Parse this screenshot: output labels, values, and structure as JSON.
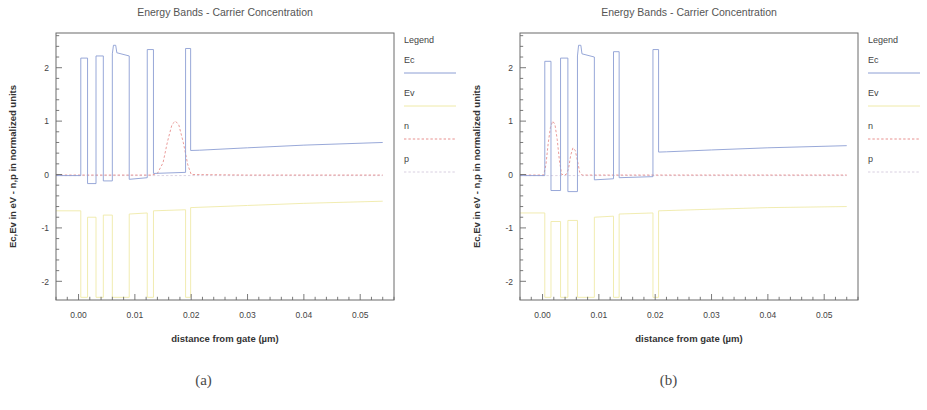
{
  "figure": {
    "captions": [
      {
        "id": "a",
        "label": "(a)"
      },
      {
        "id": "b",
        "label": "(b)"
      }
    ]
  },
  "chart_data": [
    {
      "panel": "a",
      "type": "line",
      "title": "Energy Bands - Carrier Concentration",
      "xlabel": "distance from gate (µm)",
      "ylabel": "Ec,Ev in eV - n,p in normalized units",
      "xlim": [
        -0.004,
        0.056
      ],
      "ylim": [
        -2.35,
        2.65
      ],
      "xticks": [
        0.0,
        0.01,
        0.02,
        0.03,
        0.04,
        0.05
      ],
      "xticklabels": [
        "0.00",
        "0.01",
        "0.02",
        "0.03",
        "0.04",
        "0.05"
      ],
      "yticks": [
        -2,
        -1,
        0,
        1,
        2
      ],
      "yticklabels": [
        "-2",
        "-1",
        "0",
        "1",
        "2"
      ],
      "xminor_count": 5,
      "yminor_count": 5,
      "grid": false,
      "legend": {
        "title": "Legend",
        "position": "right-outside",
        "entries": [
          {
            "name": "Ec",
            "color": "#8c9ed4",
            "style": "solid"
          },
          {
            "name": "Ev",
            "color": "#efeaa8",
            "style": "solid"
          },
          {
            "name": "n",
            "color": "#e8918f",
            "style": "dashed"
          },
          {
            "name": "p",
            "color": "#d8cfe0",
            "style": "dashed"
          }
        ]
      },
      "series": [
        {
          "name": "Ec",
          "color": "#8c9ed4",
          "style": "solid",
          "points": [
            [
              -0.004,
              -0.02
            ],
            [
              0.0004,
              -0.02
            ],
            [
              0.0004,
              2.18
            ],
            [
              0.0016,
              2.18
            ],
            [
              0.0016,
              -0.17
            ],
            [
              0.0031,
              -0.17
            ],
            [
              0.0031,
              2.22
            ],
            [
              0.0044,
              2.22
            ],
            [
              0.0044,
              -0.12
            ],
            [
              0.006,
              -0.12
            ],
            [
              0.006,
              2.26
            ],
            [
              0.0062,
              2.42
            ],
            [
              0.0066,
              2.42
            ],
            [
              0.0068,
              2.28
            ],
            [
              0.009,
              2.22
            ],
            [
              0.009,
              -0.09
            ],
            [
              0.0122,
              -0.06
            ],
            [
              0.0122,
              2.34
            ],
            [
              0.0133,
              2.34
            ],
            [
              0.0133,
              0.02
            ],
            [
              0.019,
              0.04
            ],
            [
              0.019,
              2.36
            ],
            [
              0.0199,
              2.36
            ],
            [
              0.0199,
              0.45
            ],
            [
              0.0215,
              0.455
            ],
            [
              0.03,
              0.5
            ],
            [
              0.04,
              0.55
            ],
            [
              0.054,
              0.6
            ]
          ]
        },
        {
          "name": "Ev",
          "color": "#efeaa8",
          "style": "solid",
          "points": [
            [
              -0.004,
              -0.68
            ],
            [
              0.0004,
              -0.68
            ],
            [
              0.0004,
              -2.3
            ],
            [
              0.0016,
              -2.3
            ],
            [
              0.0016,
              -0.8
            ],
            [
              0.0031,
              -0.8
            ],
            [
              0.0031,
              -2.3
            ],
            [
              0.0044,
              -2.3
            ],
            [
              0.0044,
              -0.76
            ],
            [
              0.006,
              -0.76
            ],
            [
              0.006,
              -2.3
            ],
            [
              0.009,
              -2.3
            ],
            [
              0.009,
              -0.74
            ],
            [
              0.0122,
              -0.72
            ],
            [
              0.0122,
              -2.3
            ],
            [
              0.0133,
              -2.3
            ],
            [
              0.0133,
              -0.68
            ],
            [
              0.019,
              -0.66
            ],
            [
              0.019,
              -2.3
            ],
            [
              0.0199,
              -2.3
            ],
            [
              0.0199,
              -0.62
            ],
            [
              0.03,
              -0.58
            ],
            [
              0.04,
              -0.54
            ],
            [
              0.054,
              -0.5
            ]
          ]
        },
        {
          "name": "n",
          "color": "#e8918f",
          "style": "dashed",
          "points": [
            [
              -0.004,
              -0.01
            ],
            [
              0.013,
              -0.01
            ],
            [
              0.014,
              0.02
            ],
            [
              0.015,
              0.22
            ],
            [
              0.0158,
              0.62
            ],
            [
              0.0166,
              0.94
            ],
            [
              0.0172,
              1.0
            ],
            [
              0.0178,
              0.93
            ],
            [
              0.0186,
              0.6
            ],
            [
              0.0194,
              0.18
            ],
            [
              0.02,
              0.0
            ],
            [
              0.03,
              -0.01
            ],
            [
              0.054,
              -0.01
            ]
          ]
        },
        {
          "name": "p",
          "color": "#d8cfe0",
          "style": "dashed",
          "points": [
            [
              -0.004,
              -0.02
            ],
            [
              0.02,
              -0.02
            ],
            [
              0.054,
              -0.02
            ]
          ]
        }
      ]
    },
    {
      "panel": "b",
      "type": "line",
      "title": "Energy Bands - Carrier Concentration",
      "xlabel": "distance from gate (µm)",
      "ylabel": "Ec,Ev in eV - n,p in normalized units",
      "xlim": [
        -0.004,
        0.056
      ],
      "ylim": [
        -2.35,
        2.65
      ],
      "xticks": [
        0.0,
        0.01,
        0.02,
        0.03,
        0.04,
        0.05
      ],
      "xticklabels": [
        "0.00",
        "0.01",
        "0.02",
        "0.03",
        "0.04",
        "0.05"
      ],
      "yticks": [
        -2,
        -1,
        0,
        1,
        2
      ],
      "yticklabels": [
        "-2",
        "-1",
        "0",
        "1",
        "2"
      ],
      "xminor_count": 5,
      "yminor_count": 5,
      "grid": false,
      "legend": {
        "title": "Legend",
        "position": "right-outside",
        "entries": [
          {
            "name": "Ec",
            "color": "#8c9ed4",
            "style": "solid"
          },
          {
            "name": "Ev",
            "color": "#efeaa8",
            "style": "solid"
          },
          {
            "name": "n",
            "color": "#e8918f",
            "style": "dashed"
          },
          {
            "name": "p",
            "color": "#d8cfe0",
            "style": "dashed"
          }
        ]
      },
      "series": [
        {
          "name": "Ec",
          "color": "#8c9ed4",
          "style": "solid",
          "points": [
            [
              -0.004,
              -0.02
            ],
            [
              0.0004,
              -0.02
            ],
            [
              0.0004,
              2.12
            ],
            [
              0.0015,
              2.12
            ],
            [
              0.0015,
              -0.3
            ],
            [
              0.0032,
              -0.3
            ],
            [
              0.0032,
              2.18
            ],
            [
              0.0045,
              2.18
            ],
            [
              0.0045,
              -0.32
            ],
            [
              0.0062,
              -0.32
            ],
            [
              0.0062,
              2.22
            ],
            [
              0.0064,
              2.42
            ],
            [
              0.0068,
              2.42
            ],
            [
              0.007,
              2.26
            ],
            [
              0.0092,
              2.2
            ],
            [
              0.0092,
              -0.1
            ],
            [
              0.0126,
              -0.08
            ],
            [
              0.0126,
              2.3
            ],
            [
              0.0136,
              2.3
            ],
            [
              0.0136,
              -0.06
            ],
            [
              0.0196,
              -0.04
            ],
            [
              0.0196,
              2.34
            ],
            [
              0.0206,
              2.34
            ],
            [
              0.0206,
              0.42
            ],
            [
              0.022,
              0.425
            ],
            [
              0.03,
              0.46
            ],
            [
              0.04,
              0.5
            ],
            [
              0.054,
              0.54
            ]
          ]
        },
        {
          "name": "Ev",
          "color": "#efeaa8",
          "style": "solid",
          "points": [
            [
              -0.004,
              -0.72
            ],
            [
              0.0004,
              -0.72
            ],
            [
              0.0004,
              -2.3
            ],
            [
              0.0015,
              -2.3
            ],
            [
              0.0015,
              -0.88
            ],
            [
              0.0032,
              -0.88
            ],
            [
              0.0032,
              -2.3
            ],
            [
              0.0045,
              -2.3
            ],
            [
              0.0045,
              -0.86
            ],
            [
              0.0062,
              -0.86
            ],
            [
              0.0062,
              -2.3
            ],
            [
              0.0092,
              -2.3
            ],
            [
              0.0092,
              -0.8
            ],
            [
              0.0126,
              -0.78
            ],
            [
              0.0126,
              -2.3
            ],
            [
              0.0136,
              -2.3
            ],
            [
              0.0136,
              -0.74
            ],
            [
              0.0196,
              -0.72
            ],
            [
              0.0196,
              -2.3
            ],
            [
              0.0206,
              -2.3
            ],
            [
              0.0206,
              -0.68
            ],
            [
              0.03,
              -0.65
            ],
            [
              0.04,
              -0.62
            ],
            [
              0.054,
              -0.6
            ]
          ]
        },
        {
          "name": "n",
          "color": "#e8918f",
          "style": "dashed",
          "points": [
            [
              -0.004,
              -0.01
            ],
            [
              0.0002,
              -0.01
            ],
            [
              0.0006,
              0.18
            ],
            [
              0.001,
              0.58
            ],
            [
              0.0014,
              0.88
            ],
            [
              0.0018,
              1.0
            ],
            [
              0.0022,
              0.94
            ],
            [
              0.0026,
              0.66
            ],
            [
              0.003,
              0.26
            ],
            [
              0.0034,
              0.0
            ],
            [
              0.0042,
              0.0
            ],
            [
              0.0046,
              0.1
            ],
            [
              0.005,
              0.36
            ],
            [
              0.0054,
              0.5
            ],
            [
              0.0058,
              0.45
            ],
            [
              0.0062,
              0.26
            ],
            [
              0.0066,
              0.04
            ],
            [
              0.007,
              -0.01
            ],
            [
              0.02,
              -0.01
            ],
            [
              0.054,
              -0.01
            ]
          ]
        },
        {
          "name": "p",
          "color": "#d8cfe0",
          "style": "dashed",
          "points": [
            [
              -0.004,
              -0.02
            ],
            [
              0.02,
              -0.02
            ],
            [
              0.054,
              -0.02
            ]
          ]
        }
      ]
    }
  ]
}
